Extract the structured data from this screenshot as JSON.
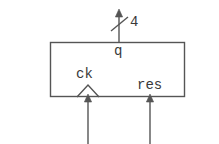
{
  "figure": {
    "type": "digital-logic-block-diagram",
    "stroke_color": "#555555",
    "text_color": "#3a3a3a",
    "background_color": "#ffffff"
  },
  "block": {
    "name": "register-block",
    "x": 50,
    "y": 42,
    "width": 135,
    "height": 55
  },
  "ports": {
    "output_q": {
      "label": "q",
      "bus_width_label": "4",
      "direction": "out",
      "edge": "top",
      "x": 119
    },
    "input_ck": {
      "label": "ck",
      "direction": "in",
      "edge": "bottom",
      "x": 88,
      "marker": "clock-triangle"
    },
    "input_res": {
      "label": "res",
      "direction": "in",
      "edge": "bottom",
      "x": 150,
      "marker": "arrow"
    }
  }
}
